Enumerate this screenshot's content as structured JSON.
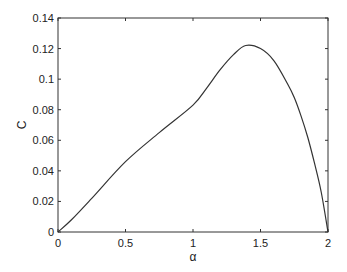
{
  "chart_data": {
    "type": "line",
    "title": "",
    "xlabel": "α",
    "ylabel": "C",
    "xlim": [
      0,
      2
    ],
    "ylim": [
      0,
      0.14
    ],
    "grid": false,
    "legend": null,
    "x_ticks": [
      "0",
      "0.5",
      "1",
      "1.5",
      "2"
    ],
    "x_tick_values": [
      0,
      0.5,
      1,
      1.5,
      2
    ],
    "y_ticks": [
      "0",
      "0.02",
      "0.04",
      "0.06",
      "0.08",
      "0.1",
      "0.12",
      "0.14"
    ],
    "y_tick_values": [
      0,
      0.02,
      0.04,
      0.06,
      0.08,
      0.1,
      0.12,
      0.14
    ],
    "series": [
      {
        "name": "C(α)",
        "x": [
          0,
          0.1,
          0.25,
          0.5,
          0.75,
          1.0,
          1.1,
          1.2,
          1.3,
          1.39,
          1.5,
          1.6,
          1.7,
          1.75,
          1.8,
          1.85,
          1.9,
          1.95,
          2.0
        ],
        "y": [
          0,
          0.008,
          0.022,
          0.046,
          0.065,
          0.083,
          0.094,
          0.106,
          0.116,
          0.122,
          0.12,
          0.112,
          0.097,
          0.088,
          0.076,
          0.062,
          0.045,
          0.026,
          0
        ]
      }
    ]
  }
}
